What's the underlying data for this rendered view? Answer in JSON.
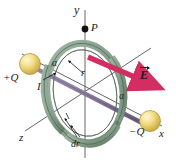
{
  "figure": {
    "background_color": "#ffffff"
  },
  "colors": {
    "axis": "#555555",
    "ring_fill": "#8fa894",
    "ring_shade": "#6f8a76",
    "ring_outline": "#4d6355",
    "rod": "#8a7f9e",
    "rod_dark": "#6d6382",
    "sphere": "#f2dd7e",
    "sphere_highlight": "#fdf6cf",
    "sphere_edge": "#b49a3c",
    "field_arrow": "#d42d62",
    "label": "#1a1a1a"
  },
  "labels": {
    "y_axis": "y",
    "x_axis": "x",
    "z_axis": "z",
    "point_p": "P",
    "charge_positive": "+Q",
    "charge_negative": "−Q",
    "distance_left": "a",
    "distance_right": "a",
    "current": "I",
    "radius": "r",
    "thickness": "dr",
    "field_vector": "E"
  },
  "icons": {
    "point_marker": "point-p-dot",
    "field_vector_arrow": "electric-field-arrow",
    "current_arrow": "current-direction-arrow",
    "radius_arrow": "radius-leader-arrow",
    "thickness_leader": "dr-leader-lines"
  }
}
